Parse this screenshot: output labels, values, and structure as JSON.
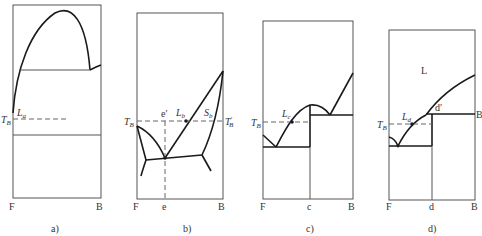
{
  "figure": {
    "panels": [
      {
        "id": "a",
        "caption": "a)",
        "x_axis": {
          "left": "F",
          "right": "B"
        },
        "labels": {
          "temperature": "T",
          "temperature_sub": "B",
          "point": "L",
          "point_sub": "a"
        }
      },
      {
        "id": "b",
        "caption": "b)",
        "x_axis": {
          "left": "F",
          "mid": "e",
          "right": "B"
        },
        "labels": {
          "temperature_left": "T",
          "temperature_left_sub": "B",
          "temperature_right": "T",
          "temperature_right_sub": "B",
          "temperature_right_prime": "′",
          "eutectic_prime": "e′",
          "liquidus_point": "L",
          "liquidus_point_sub": "b",
          "solidus_point": "S",
          "solidus_point_sub": "b"
        }
      },
      {
        "id": "c",
        "caption": "c)",
        "x_axis": {
          "left": "F",
          "mid": "c",
          "right": "B"
        },
        "labels": {
          "temperature": "T",
          "temperature_sub": "B",
          "point": "L",
          "point_sub": "c"
        }
      },
      {
        "id": "d",
        "caption": "d)",
        "x_axis": {
          "left": "F",
          "mid": "d",
          "right": "B"
        },
        "labels": {
          "temperature": "T",
          "temperature_sub": "B",
          "point": "L",
          "point_sub": "d",
          "region": "L",
          "peritectic_prime": "d′",
          "line_end": "B"
        }
      }
    ]
  }
}
